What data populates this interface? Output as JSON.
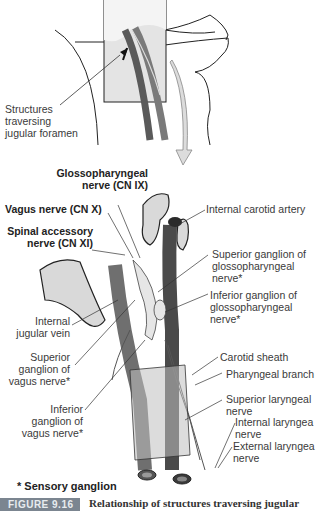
{
  "figure": {
    "number_label": "FIGURE 9.16",
    "caption": "Relationship of structures traversing jugular",
    "footnote": "* Sensory ganglion"
  },
  "inset": {
    "label": "Structures\ntraversing\njugular foramen"
  },
  "labels": {
    "glossopharyngeal": "Glossopharyngeal\nnerve (CN IX)",
    "vagus": "Vagus nerve (CN X)",
    "spinal_accessory": "Spinal accessory\nnerve (CN XI)",
    "internal_carotid": "Internal carotid artery",
    "sup_ganglion_glosso": "Superior ganglion of\nglossopharyngeal\nnerve*",
    "inf_ganglion_glosso": "Inferior ganglion of\nglossopharyngeal\nnerve*",
    "internal_jugular": "Internal\njugular vein",
    "sup_ganglion_vagus": "Superior\nganglion of\nvagus nerve*",
    "carotid_sheath": "Carotid sheath",
    "pharyngeal_branch": "Pharyngeal branch",
    "inf_ganglion_vagus": "Inferior\nganglion of\nvagus nerve*",
    "superior_laryngeal": "Superior laryngeal\nnerve",
    "internal_laryngeal": "Internal laryngea\nnerve",
    "external_laryngeal": "External laryngea\nnerve"
  },
  "colors": {
    "vessel": "#6f6f6f",
    "vessel_dark": "#4a4a4a",
    "bone": "#d9d9d9",
    "nerve": "#e6e6e6",
    "arrow": "#dcdcdc",
    "caption_tag": "#7b8590"
  }
}
